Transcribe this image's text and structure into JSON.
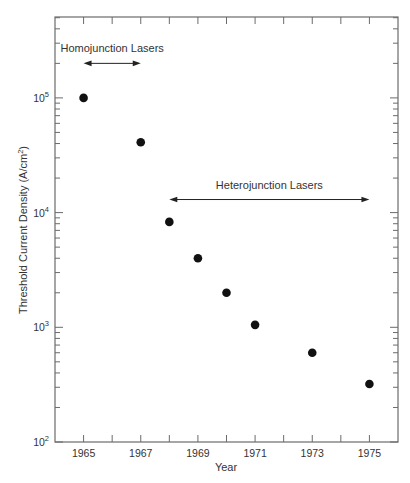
{
  "chart_data": {
    "type": "scatter",
    "title": "",
    "xlabel": "Year",
    "ylabel": "Threshold Current Density (A/cm²)",
    "ylabel_parts": {
      "main": "Threshold Current Density (A/cm",
      "sup": "2",
      "tail": ")"
    },
    "y_scale": "log",
    "xlim": [
      1964,
      1976
    ],
    "ylim": [
      100,
      500000
    ],
    "x_ticks": [
      1965,
      1966,
      1967,
      1968,
      1969,
      1970,
      1971,
      1972,
      1973,
      1974,
      1975
    ],
    "x_tick_labels": [
      "1965",
      "1967",
      "1969",
      "1971",
      "1973",
      "1975"
    ],
    "y_decades": [
      {
        "value": 100,
        "base": "10",
        "exp": "2"
      },
      {
        "value": 1000,
        "base": "10",
        "exp": "3"
      },
      {
        "value": 10000,
        "base": "10",
        "exp": "4"
      },
      {
        "value": 100000,
        "base": "10",
        "exp": "5"
      }
    ],
    "grid": false,
    "series": [
      {
        "name": "Threshold current density",
        "x": [
          1965,
          1967,
          1968,
          1969,
          1970,
          1971,
          1973,
          1975
        ],
        "y": [
          100000,
          41000,
          8300,
          4000,
          2000,
          1050,
          600,
          320
        ]
      }
    ],
    "annotations": [
      {
        "text": "Homojunction Lasers",
        "x_from": 1965,
        "x_to": 1967,
        "y": 200000
      },
      {
        "text": "Heterojunction Lasers",
        "x_from": 1968,
        "x_to": 1975,
        "y": 13000
      }
    ]
  }
}
